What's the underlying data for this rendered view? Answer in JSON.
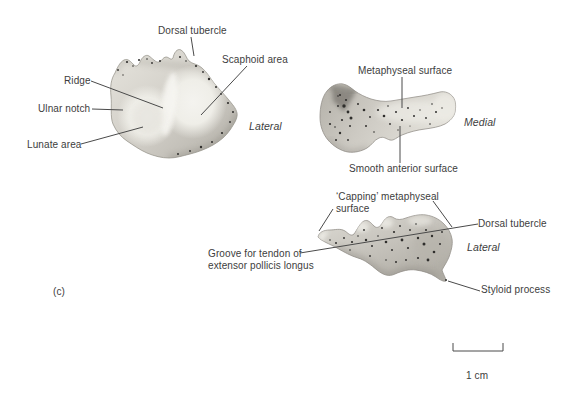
{
  "figure": {
    "panel_label": "(c)",
    "scale_bar_label": "1 cm",
    "colors": {
      "ink": "#3d3d3d",
      "leader_line": "#4a4a4a",
      "bone_light": "#f4f3ef",
      "bone_mid": "#cfccc5",
      "bone_dark": "#8e8b84",
      "speckle": "#2f2e2c",
      "background": "#ffffff"
    },
    "distal_view": {
      "orientation": "Lateral",
      "labels": {
        "dorsal_tubercle": "Dorsal tubercle",
        "scaphoid_area": "Scaphoid area",
        "ridge": "Ridge",
        "ulnar_notch": "Ulnar notch",
        "lunate_area": "Lunate area"
      }
    },
    "medial_view": {
      "orientation": "Medial",
      "labels": {
        "metaphyseal_surface": "Metaphyseal surface",
        "smooth_anterior_surface": "Smooth anterior surface"
      }
    },
    "lateral_view": {
      "orientation": "Lateral",
      "labels": {
        "capping_metaphyseal_surface_line1": "‘Capping’ metaphyseal",
        "capping_metaphyseal_surface_line2": "surface",
        "dorsal_tubercle": "Dorsal tubercle",
        "groove_line1": "Groove for tendon of",
        "groove_line2": "extensor pollicis longus",
        "styloid_process": "Styloid process"
      }
    }
  }
}
